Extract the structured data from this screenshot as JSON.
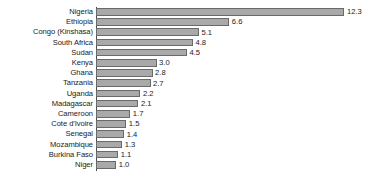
{
  "chart_data": {
    "type": "bar",
    "orientation": "horizontal",
    "title": "",
    "subtitle": "",
    "xlabel": "",
    "ylabel": "",
    "grid": false,
    "legend": null,
    "legend_position": "none",
    "xlim": [
      0,
      13.5
    ],
    "categories": [
      "Nigeria",
      "Ethiopia",
      "Congo (Kinshasa)",
      "South Africa",
      "Sudan",
      "Kenya",
      "Ghana",
      "Tanzania",
      "Uganda",
      "Madagascar",
      "Cameroon",
      "Cote d'Ivoire",
      "Senegal",
      "Mozambique",
      "Burkina Faso",
      "Niger"
    ],
    "values": [
      12.3,
      6.6,
      5.1,
      4.8,
      4.5,
      3.0,
      2.8,
      2.7,
      2.2,
      2.1,
      1.7,
      1.5,
      1.4,
      1.3,
      1.1,
      1.0
    ],
    "value_labels": [
      "12.3",
      "6.6",
      "5.1",
      "4.8",
      "4.5",
      "3.0",
      "2.8",
      "2.7",
      "2.2",
      "2.1",
      "1.7",
      "1.5",
      "1.4",
      "1.3",
      "1.1",
      "1.0"
    ],
    "bar_color": "#a9a9a9",
    "bar_border_color": "#6a6a6a",
    "axis_color": "#4a4a4a",
    "text_color": "#1a1a1a",
    "background_color": "#ffffff"
  },
  "layout": {
    "axis_x": 96,
    "top_offset": 7,
    "row_pitch": 10.2,
    "px_per_unit": 20.2,
    "label_right_edge": 93
  }
}
